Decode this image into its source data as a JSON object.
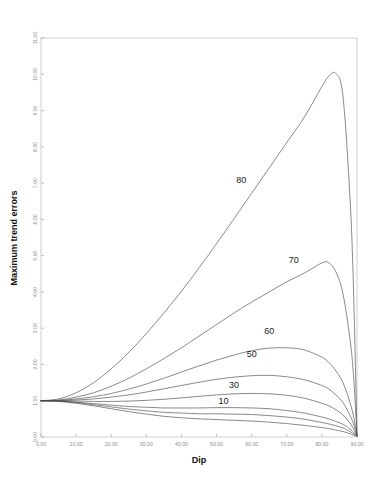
{
  "chart_data": {
    "type": "line",
    "title": "",
    "xlabel": "Dip",
    "ylabel": "Maximum trend errors",
    "xlim": [
      0,
      90
    ],
    "ylim": [
      0,
      11
    ],
    "grid": false,
    "legend_position": "inline-curve-labels",
    "xticks": [
      0,
      10,
      20,
      30,
      40,
      50,
      60,
      70,
      80,
      90
    ],
    "xticklabels": [
      "0.00",
      "10.00",
      "20.00",
      "30.00",
      "40.00",
      "50.00",
      "60.00",
      "70.00",
      "80.00",
      "90.00"
    ],
    "yticks": [
      0,
      1,
      2,
      3,
      4,
      5,
      6,
      7,
      8,
      9,
      10,
      11
    ],
    "yticklabels": [
      "0.00",
      "1.00",
      "2.00",
      "3.00",
      "4.00",
      "5.00",
      "6.00",
      "7.00",
      "8.00",
      "9.00",
      "10.00",
      "11.00"
    ],
    "x": [
      0,
      5,
      10,
      15,
      20,
      25,
      30,
      35,
      40,
      45,
      50,
      55,
      60,
      65,
      70,
      75,
      80,
      82,
      84,
      86,
      88,
      89,
      90
    ],
    "series": [
      {
        "name": "80",
        "label": "80",
        "label_x": 57,
        "label_y": 7.0,
        "values": [
          1.0,
          1.05,
          1.22,
          1.5,
          1.88,
          2.33,
          2.85,
          3.42,
          4.02,
          4.66,
          5.33,
          6.02,
          6.72,
          7.42,
          8.12,
          8.82,
          9.66,
          9.95,
          10.02,
          9.4,
          6.6,
          4.1,
          0.05
        ]
      },
      {
        "name": "70",
        "label": "70",
        "label_x": 72,
        "label_y": 4.8,
        "values": [
          1.0,
          1.02,
          1.1,
          1.22,
          1.4,
          1.62,
          1.88,
          2.16,
          2.46,
          2.78,
          3.1,
          3.42,
          3.72,
          4.0,
          4.28,
          4.52,
          4.8,
          4.8,
          4.55,
          3.95,
          2.7,
          1.7,
          0.05
        ]
      },
      {
        "name": "60",
        "label": "60",
        "label_x": 65,
        "label_y": 2.85,
        "values": [
          1.0,
          1.01,
          1.05,
          1.11,
          1.2,
          1.32,
          1.46,
          1.62,
          1.79,
          1.96,
          2.12,
          2.26,
          2.38,
          2.45,
          2.46,
          2.4,
          2.2,
          2.05,
          1.82,
          1.5,
          0.95,
          0.58,
          0.05
        ]
      },
      {
        "name": "50",
        "label": "50",
        "label_x": 60,
        "label_y": 2.2,
        "values": [
          1.0,
          1.0,
          1.02,
          1.05,
          1.1,
          1.16,
          1.24,
          1.33,
          1.42,
          1.51,
          1.59,
          1.65,
          1.69,
          1.7,
          1.66,
          1.58,
          1.42,
          1.32,
          1.16,
          0.95,
          0.6,
          0.36,
          0.04
        ]
      },
      {
        "name": "30",
        "label": "30",
        "label_x": 55,
        "label_y": 1.35,
        "values": [
          1.0,
          0.99,
          0.96,
          0.92,
          0.88,
          0.84,
          0.82,
          0.8,
          0.8,
          0.8,
          0.81,
          0.81,
          0.8,
          0.78,
          0.73,
          0.66,
          0.55,
          0.5,
          0.43,
          0.35,
          0.22,
          0.13,
          0.03
        ]
      },
      {
        "name": "10",
        "label": "10",
        "label_x": 52,
        "label_y": 0.9,
        "values": [
          1.0,
          0.98,
          0.93,
          0.86,
          0.78,
          0.7,
          0.63,
          0.57,
          0.53,
          0.5,
          0.48,
          0.46,
          0.44,
          0.41,
          0.37,
          0.32,
          0.26,
          0.23,
          0.19,
          0.15,
          0.09,
          0.05,
          0.02
        ]
      },
      {
        "name": "20",
        "label": "",
        "label_x": null,
        "label_y": null,
        "values": [
          1.0,
          0.99,
          0.95,
          0.89,
          0.83,
          0.77,
          0.72,
          0.68,
          0.66,
          0.64,
          0.64,
          0.63,
          0.62,
          0.59,
          0.55,
          0.49,
          0.4,
          0.36,
          0.31,
          0.25,
          0.15,
          0.09,
          0.02
        ]
      },
      {
        "name": "40",
        "label": "",
        "label_x": null,
        "label_y": null,
        "values": [
          1.0,
          1.0,
          0.99,
          0.98,
          0.98,
          0.99,
          1.01,
          1.04,
          1.08,
          1.12,
          1.16,
          1.19,
          1.2,
          1.19,
          1.15,
          1.07,
          0.93,
          0.86,
          0.75,
          0.61,
          0.38,
          0.23,
          0.03
        ]
      }
    ],
    "annotations": [
      "80",
      "70",
      "60",
      "50",
      "30",
      "10"
    ]
  },
  "axes": {
    "x_title": "Dip",
    "y_title": "Maximum trend errors"
  }
}
